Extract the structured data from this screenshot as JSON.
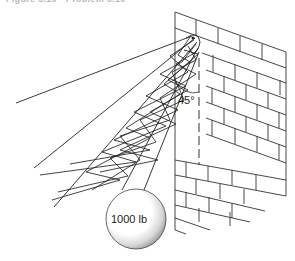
{
  "figure": {
    "caption": "Figure 5.10 • Problem 5.10"
  },
  "diagram": {
    "angle_label": "45°",
    "weight_label": "1000 lb",
    "elements": [
      {
        "name": "brick-wall",
        "description": "Brick wall shown in perspective on the right"
      },
      {
        "name": "anchor-point",
        "description": "Attachment point on wall corner"
      },
      {
        "name": "rope-lines",
        "description": "Straight lines radiating from anchor to the left"
      },
      {
        "name": "net-lattice",
        "description": "Criss-crossing lattice between rope lines"
      },
      {
        "name": "vertical-dashed-reference",
        "description": "Dashed vertical reference line along wall"
      },
      {
        "name": "weight-ball",
        "description": "Shaded sphere hanging from rope"
      }
    ]
  }
}
